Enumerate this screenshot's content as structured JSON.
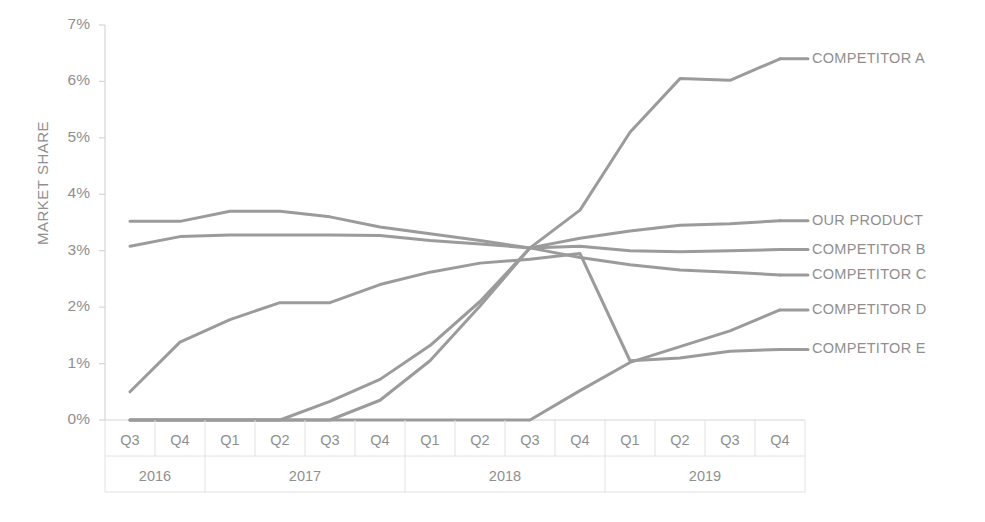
{
  "chart_data": {
    "type": "line",
    "title": "",
    "xlabel": "",
    "ylabel": "MARKET SHARE",
    "ylim": [
      0,
      7
    ],
    "ytick_labels": [
      "7%",
      "6%",
      "5%",
      "4%",
      "3%",
      "2%",
      "1%",
      "0%"
    ],
    "ytick_values": [
      7,
      6,
      5,
      4,
      3,
      2,
      1,
      0
    ],
    "grid": false,
    "legend_position": "right-inline",
    "x": [
      "2016 Q3",
      "2016 Q4",
      "2017 Q1",
      "2017 Q2",
      "2017 Q3",
      "2017 Q4",
      "2018 Q1",
      "2018 Q2",
      "2018 Q3",
      "2018 Q4",
      "2019 Q1",
      "2019 Q2",
      "2019 Q3",
      "2019 Q4"
    ],
    "categories": [
      "Q3",
      "Q4",
      "Q1",
      "Q2",
      "Q3",
      "Q4",
      "Q1",
      "Q2",
      "Q3",
      "Q4",
      "Q1",
      "Q2",
      "Q3",
      "Q4"
    ],
    "year_groups": [
      {
        "label": "2016",
        "span": 2
      },
      {
        "label": "2017",
        "span": 4
      },
      {
        "label": "2018",
        "span": 4
      },
      {
        "label": "2019",
        "span": 4
      }
    ],
    "series": [
      {
        "name": "COMPETITOR A",
        "label_y_percent": 6.4,
        "values": [
          0,
          0,
          0,
          0,
          0.33,
          0.72,
          1.32,
          2.1,
          3.05,
          3.72,
          5.1,
          6.05,
          6.02,
          6.4
        ]
      },
      {
        "name": "OUR PRODUCT",
        "label_y_percent": 3.53,
        "values": [
          3.08,
          3.25,
          3.28,
          3.28,
          3.28,
          3.27,
          3.18,
          3.12,
          3.05,
          3.22,
          3.35,
          3.45,
          3.48,
          3.53
        ]
      },
      {
        "name": "COMPETITOR B",
        "label_y_percent": 3.02,
        "values": [
          0,
          0,
          0,
          0,
          0,
          0.35,
          1.05,
          2.02,
          3.05,
          3.08,
          3.0,
          2.98,
          3.0,
          3.02
        ]
      },
      {
        "name": "COMPETITOR C",
        "label_y_percent": 2.57,
        "values": [
          3.52,
          3.52,
          3.7,
          3.7,
          3.6,
          3.42,
          3.3,
          3.18,
          3.05,
          2.88,
          2.75,
          2.66,
          2.62,
          2.57
        ]
      },
      {
        "name": "COMPETITOR D",
        "label_y_percent": 1.95,
        "values": [
          0,
          0,
          0,
          0,
          0,
          0,
          0,
          0,
          0,
          0.52,
          1.02,
          1.3,
          1.58,
          1.95
        ]
      },
      {
        "name": "COMPETITOR E",
        "label_y_percent": 1.25,
        "values": [
          0.5,
          1.38,
          1.78,
          2.08,
          2.08,
          2.4,
          2.62,
          2.78,
          2.85,
          2.95,
          1.05,
          1.1,
          1.22,
          1.25
        ]
      }
    ]
  },
  "colors": {
    "line": "#9b9b9b",
    "text": "#8f8f8f",
    "axis": "#d5d5d5",
    "grid": "#e2e2e2",
    "background": "#ffffff"
  },
  "axis": {
    "y_title": "MARKET SHARE"
  }
}
